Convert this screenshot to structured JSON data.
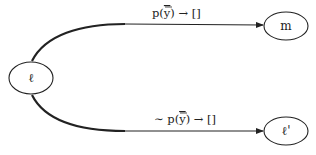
{
  "diagram": {
    "nodes": [
      {
        "id": "l",
        "label": "ℓ",
        "cx": 31,
        "cy": 78,
        "rx": 22,
        "ry": 16
      },
      {
        "id": "m",
        "label": "m",
        "cx": 286,
        "cy": 26,
        "rx": 22,
        "ry": 14
      },
      {
        "id": "l_prime",
        "label": "ℓ'",
        "cx": 286,
        "cy": 131,
        "rx": 22,
        "ry": 14
      }
    ],
    "edges": [
      {
        "from": "l",
        "to": "m",
        "label_pre": "p(",
        "label_var": "y",
        "label_post": ") → []"
      },
      {
        "from": "l",
        "to": "l_prime",
        "label_pre": "∼ p(",
        "label_var": "y",
        "label_post": ") → []"
      }
    ],
    "colors": {
      "stroke": "#222222",
      "background": "#ffffff"
    }
  }
}
